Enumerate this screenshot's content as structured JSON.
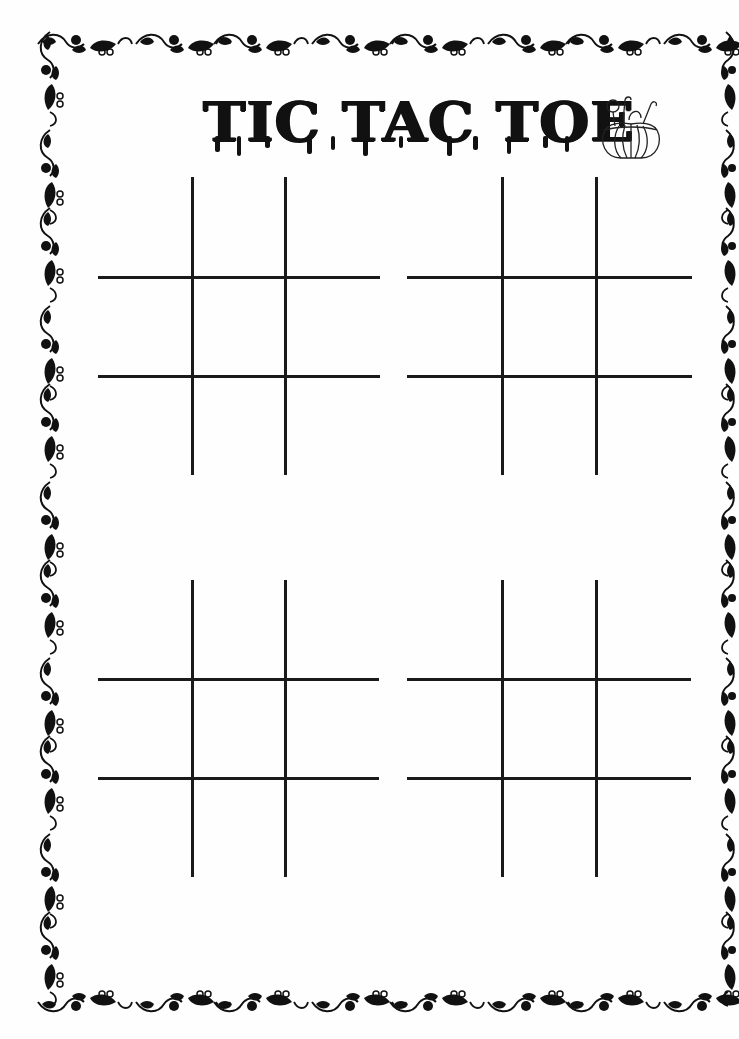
{
  "page": {
    "title": "TIC TAC TOE",
    "title_icon": "pumpkin-candy-bucket-icon",
    "border_style": "black floral vine ornament",
    "colors": {
      "ink": "#111111",
      "paper": "#fefefe"
    }
  },
  "boards": [
    {
      "id": 1,
      "position": "top-left",
      "rows": 3,
      "cols": 3,
      "cells": [
        "",
        "",
        "",
        "",
        "",
        "",
        "",
        "",
        ""
      ]
    },
    {
      "id": 2,
      "position": "top-right",
      "rows": 3,
      "cols": 3,
      "cells": [
        "",
        "",
        "",
        "",
        "",
        "",
        "",
        "",
        ""
      ]
    },
    {
      "id": 3,
      "position": "bottom-left",
      "rows": 3,
      "cols": 3,
      "cells": [
        "",
        "",
        "",
        "",
        "",
        "",
        "",
        "",
        ""
      ]
    },
    {
      "id": 4,
      "position": "bottom-right",
      "rows": 3,
      "cols": 3,
      "cells": [
        "",
        "",
        "",
        "",
        "",
        "",
        "",
        "",
        ""
      ]
    }
  ]
}
